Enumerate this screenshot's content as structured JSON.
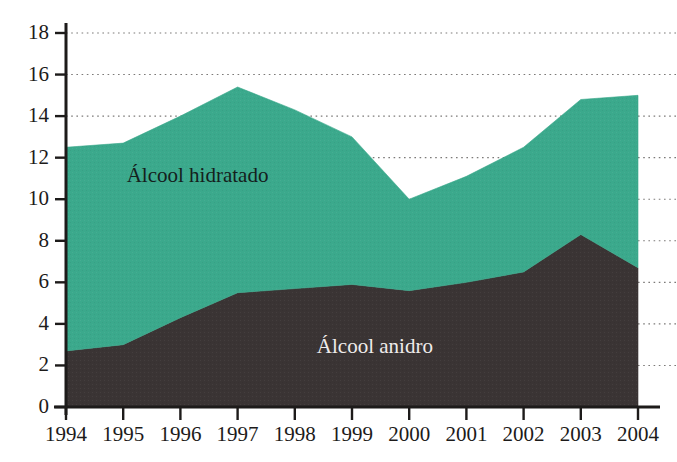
{
  "chart_data": {
    "type": "area",
    "stacked": true,
    "title": "",
    "subtitle": "",
    "xlabel": "",
    "ylabel": "",
    "categories": [
      "1994",
      "1995",
      "1996",
      "1997",
      "1998",
      "1999",
      "2000",
      "2001",
      "2002",
      "2003",
      "2004"
    ],
    "x": [
      1994,
      1995,
      1996,
      1997,
      1998,
      1999,
      2000,
      2001,
      2002,
      2003,
      2004
    ],
    "series": [
      {
        "name": "Álcool anidro",
        "color": "#3a3434",
        "values": [
          2.7,
          3.0,
          4.3,
          5.5,
          5.7,
          5.9,
          5.6,
          6.0,
          6.5,
          8.3,
          6.7
        ]
      },
      {
        "name": "Álcool hidratado",
        "color": "#3ba98c",
        "values": [
          9.8,
          9.7,
          9.7,
          9.9,
          8.6,
          7.1,
          4.4,
          5.1,
          6.0,
          6.5,
          8.3
        ]
      }
    ],
    "cumulative_totals": [
      12.5,
      12.7,
      14.0,
      15.4,
      14.3,
      13.0,
      10.0,
      11.1,
      12.5,
      14.8,
      15.0
    ],
    "ylim": [
      0,
      18
    ],
    "xlim": [
      1994,
      2004
    ],
    "yticks": [
      0,
      2,
      4,
      6,
      8,
      10,
      12,
      14,
      16,
      18
    ],
    "ytick_labels": [
      "0",
      "2",
      "4",
      "6",
      "8",
      "10",
      "12",
      "14",
      "16",
      "18"
    ],
    "xtick_labels": [
      "1994",
      "1995",
      "1996",
      "1997",
      "1998",
      "1999",
      "2000",
      "2001",
      "2002",
      "2003",
      "2004"
    ],
    "grid": "horizontal-dotted",
    "legend": "inline-annotations",
    "annotations": [
      {
        "text": "Álcool hidratado",
        "x": 1996.3,
        "y": 11.1
      },
      {
        "text": "Álcool anidro",
        "x": 1999.4,
        "y": 2.9
      }
    ],
    "colors": {
      "hidratado": "#3ba98c",
      "anidro": "#3a3434",
      "axis": "#1d1b1a",
      "grid": "#7c7a78",
      "background": "#ffffff"
    }
  }
}
